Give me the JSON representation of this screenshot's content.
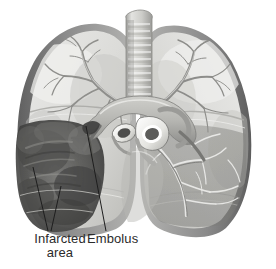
{
  "figure": {
    "background_color": "#ffffff",
    "ink_color": "#2b2b2b",
    "view": "anterior coronal section of both lungs, mediastinum and great vessels"
  },
  "labels": [
    {
      "id": "infarcted-area",
      "line1": "Infarcted",
      "line2": "area",
      "x": 18,
      "y": 232,
      "leaders": 2
    },
    {
      "id": "embolus",
      "line1": "Embolus",
      "x": 87,
      "y": 232,
      "leaders": 1
    }
  ],
  "leader_lines": [
    {
      "name": "infarct-leader-upper",
      "x1": 33,
      "y1": 167,
      "x2": 48,
      "y2": 231
    },
    {
      "name": "infarct-leader-lower",
      "x1": 61,
      "y1": 186,
      "x2": 51,
      "y2": 231
    },
    {
      "name": "embolus-leader",
      "x1": 86,
      "y1": 126,
      "x2": 106,
      "y2": 231
    }
  ],
  "structures": {
    "trachea": "trachea with cartilage rings",
    "left_lung": "left lung, upper lobe, opened to show pulmonary vasculature",
    "right_lung": "right lung with branching pulmonary arteries",
    "infarct": "dark mottled wedge-shaped infarcted region in lower lobe",
    "great_vessels": "cut cross-sections of pulmonary artery and aorta at hilum",
    "pleura": "dark grey pleural border around lung margins"
  },
  "colors": {
    "background": "#ffffff",
    "pleura_dark": "#6f6f6f",
    "pleura_mid": "#8d8d8d",
    "lung_parenchyma_light": "#e8e8e6",
    "lung_parenchyma_mid": "#cfcfcc",
    "lung_shadow": "#a9a9a6",
    "infarct_dark": "#4f4f4f",
    "infarct_mid": "#6b6b6b",
    "vessel_dark": "#7c7c7a",
    "vessel_light": "#f2f2f0",
    "lumen": "#ffffff",
    "label_ink": "#2b2b2b"
  }
}
